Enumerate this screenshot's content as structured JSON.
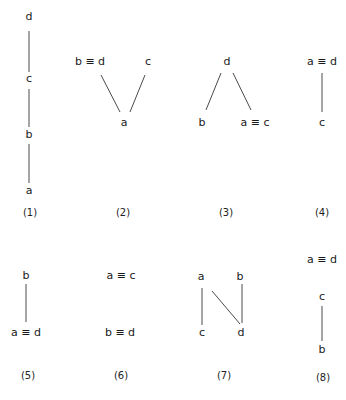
{
  "diagrams": [
    {
      "caption": "(1)",
      "nodes": [
        {
          "id": "d",
          "label": "d"
        },
        {
          "id": "c",
          "label": "c"
        },
        {
          "id": "b",
          "label": "b"
        },
        {
          "id": "a",
          "label": "a"
        }
      ],
      "edges": [
        [
          "d",
          "c"
        ],
        [
          "c",
          "b"
        ],
        [
          "b",
          "a"
        ]
      ]
    },
    {
      "caption": "(2)",
      "nodes": [
        {
          "id": "bd",
          "label": "b ≡ d"
        },
        {
          "id": "c",
          "label": "c"
        },
        {
          "id": "a",
          "label": "a"
        }
      ],
      "edges": [
        [
          "bd",
          "a"
        ],
        [
          "c",
          "a"
        ]
      ]
    },
    {
      "caption": "(3)",
      "nodes": [
        {
          "id": "d",
          "label": "d"
        },
        {
          "id": "b",
          "label": "b"
        },
        {
          "id": "ac",
          "label": "a ≡ c"
        }
      ],
      "edges": [
        [
          "d",
          "b"
        ],
        [
          "d",
          "ac"
        ]
      ]
    },
    {
      "caption": "(4)",
      "nodes": [
        {
          "id": "ad",
          "label": "a ≡ d"
        },
        {
          "id": "c",
          "label": "c"
        }
      ],
      "edges": [
        [
          "ad",
          "c"
        ]
      ]
    },
    {
      "caption": "(5)",
      "nodes": [
        {
          "id": "b",
          "label": "b"
        },
        {
          "id": "ad",
          "label": "a ≡ d"
        }
      ],
      "edges": [
        [
          "b",
          "ad"
        ]
      ]
    },
    {
      "caption": "(6)",
      "nodes": [
        {
          "id": "ac",
          "label": "a ≡ c"
        },
        {
          "id": "bd",
          "label": "b ≡ d"
        }
      ],
      "edges": []
    },
    {
      "caption": "(7)",
      "nodes": [
        {
          "id": "a",
          "label": "a"
        },
        {
          "id": "b",
          "label": "b"
        },
        {
          "id": "c",
          "label": "c"
        },
        {
          "id": "d",
          "label": "d"
        }
      ],
      "edges": [
        [
          "a",
          "c"
        ],
        [
          "a",
          "d"
        ],
        [
          "b",
          "d"
        ]
      ]
    },
    {
      "caption": "(8)",
      "nodes": [
        {
          "id": "ad",
          "label": "a ≡ d"
        },
        {
          "id": "c",
          "label": "c"
        },
        {
          "id": "b",
          "label": "b"
        }
      ],
      "edges": [
        [
          "c",
          "b"
        ]
      ]
    }
  ]
}
